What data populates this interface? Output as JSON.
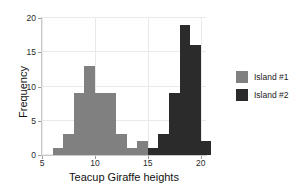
{
  "chart_data": {
    "type": "bar",
    "title": "",
    "subtitle": "",
    "xlabel": "Teacup Giraffe heights",
    "ylabel": "Frequency",
    "xlim": [
      5,
      20.5
    ],
    "ylim": [
      0,
      20
    ],
    "xticks": [
      5,
      10,
      15,
      20
    ],
    "yticks": [
      0,
      5,
      10,
      15,
      20
    ],
    "xtick_labels": [
      "5",
      "10",
      "15",
      "20"
    ],
    "ytick_labels": [
      "0",
      "5",
      "10",
      "15",
      "20"
    ],
    "grid": true,
    "legend_position": "right",
    "bin_width": 1,
    "series": [
      {
        "name": "Island #1",
        "color": "#808080",
        "bins": [
          6,
          7,
          8,
          9,
          10,
          11,
          12,
          13,
          14
        ],
        "values": [
          1,
          3,
          9,
          13,
          9,
          9,
          3,
          1,
          2
        ]
      },
      {
        "name": "Island #2",
        "color": "#2b2b2b",
        "bins": [
          15,
          16,
          17,
          18,
          19,
          20
        ],
        "values": [
          1,
          3,
          9,
          19,
          16,
          2
        ]
      }
    ]
  },
  "legend": {
    "entries": [
      {
        "label": "Island #1",
        "color": "#808080"
      },
      {
        "label": "Island #2",
        "color": "#2b2b2b"
      }
    ]
  },
  "colors": {
    "island1": "#808080",
    "island2": "#2b2b2b",
    "grid": "#e9e9e9",
    "axis": "#c9c9c9",
    "text": "#1a1a1a",
    "background": "#ffffff"
  }
}
